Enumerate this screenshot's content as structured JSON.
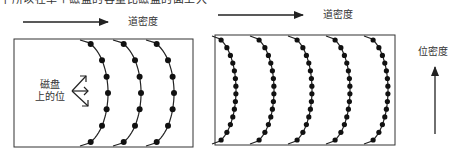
{
  "caption_partial": "下所以在单个磁盘的容量比磁盘的面上大",
  "left_panel": {
    "track_density_label": "道密度",
    "bits_label_line1": "磁盘",
    "bits_label_line2": "上的位",
    "arcs": 3,
    "dots_per_arc": 7
  },
  "right_panel": {
    "track_density_label": "道密度",
    "bit_density_label": "位密度",
    "arcs": 5,
    "dots_per_arc": 14
  },
  "colors": {
    "line": "#222222",
    "dot": "#111111",
    "frame": "#333333"
  }
}
